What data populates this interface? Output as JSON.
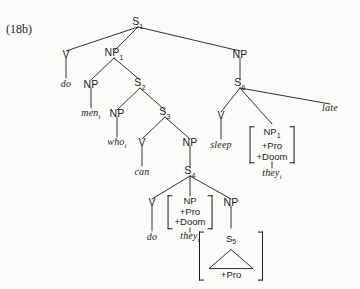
{
  "figure": {
    "example_label": "(18b)",
    "ink_color": "#1b1b1b",
    "background_color": "#fbfbf9"
  },
  "nodes": {
    "s1": "S1",
    "v_do_top": "V",
    "np1": "NP1",
    "np_men": "NP",
    "s2": "S2",
    "np_who": "NP",
    "s3": "S3",
    "v_can": "V",
    "np_s4": "NP",
    "s4": "S4",
    "v_do_bottom": "V",
    "np_s5": "NP",
    "s5": "S5",
    "np_right": "NP",
    "s6": "S6",
    "v_sleep": "V"
  },
  "node_labels": {
    "s1_base": "S",
    "s1_sub": "1",
    "s2_base": "S",
    "s2_sub": "2",
    "s3_base": "S",
    "s3_sub": "3",
    "s4_base": "S",
    "s4_sub": "4",
    "s5_base": "S",
    "s5_sub": "5",
    "s6_base": "S",
    "s6_sub": "6",
    "np1_base": "NP",
    "np1_sub": "1",
    "np_plain": "NP",
    "v_plain": "V"
  },
  "words": {
    "do_top_base": "do",
    "do_top_sub": "",
    "men_base": "men",
    "men_sub": "i",
    "who_base": "who",
    "who_sub": "i",
    "can_base": "can",
    "can_sub": "",
    "do_bottom_base": "do",
    "do_bottom_sub": "",
    "they_bottom_base": "they",
    "they_bottom_sub": "i",
    "sleep_base": "sleep",
    "sleep_sub": "",
    "they_right_base": "they",
    "they_right_sub": "i",
    "late_base": "late",
    "late_sub": ""
  },
  "feature_matrices": {
    "right": {
      "head_base": "NP",
      "head_sub": "1",
      "feature_1": "+Pro",
      "feature_2": "+Doom"
    },
    "lower": {
      "head_base": "NP",
      "head_sub": "",
      "feature_1": "+Pro",
      "feature_2": "+Doom"
    },
    "s5_box": {
      "head_base": "S",
      "head_sub": "5",
      "feature_1": "+Pro"
    }
  }
}
